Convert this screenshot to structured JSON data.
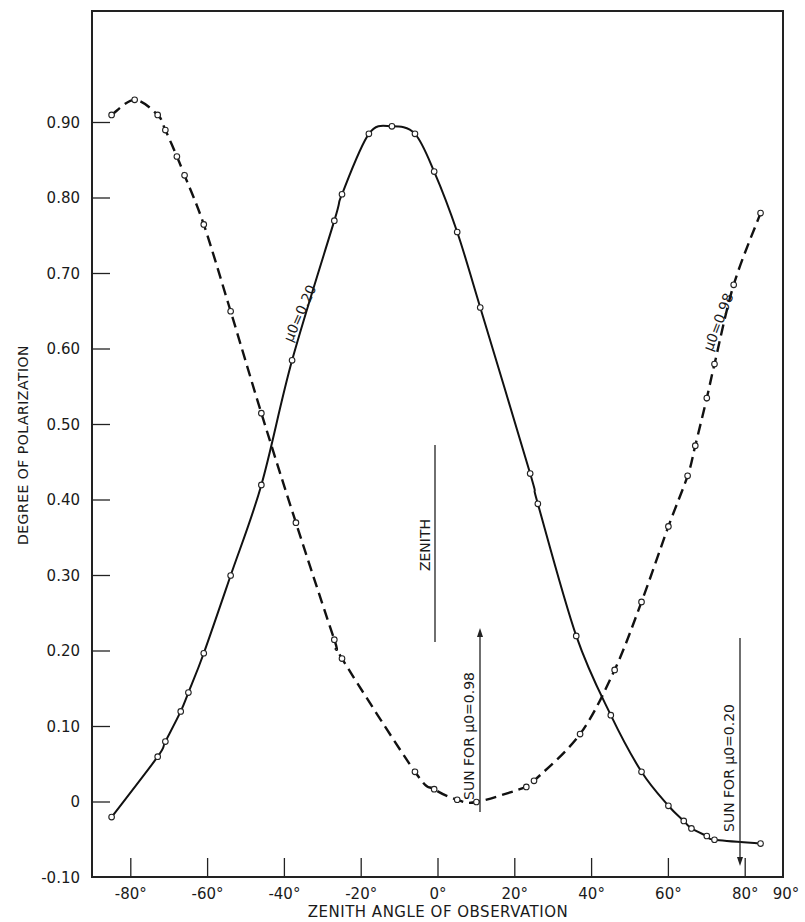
{
  "chart_data": {
    "type": "line",
    "title": "",
    "xlabel": "ZENITH ANGLE OF OBSERVATION",
    "ylabel": "DEGREE OF POLARIZATION",
    "xlim": [
      -90,
      90
    ],
    "ylim": [
      -0.1,
      1.0
    ],
    "grid": false,
    "x_ticks": [
      -80,
      -60,
      -40,
      -20,
      0,
      20,
      40,
      60,
      80
    ],
    "x_tick_labels": [
      "-80°",
      "-60°",
      "-40°",
      "-20°",
      "0°",
      "20°",
      "40°",
      "60°",
      "80°",
      "90°"
    ],
    "y_ticks": [
      -0.1,
      0,
      0.1,
      0.2,
      0.3,
      0.4,
      0.5,
      0.6,
      0.7,
      0.8,
      0.9
    ],
    "y_tick_labels": [
      "-0.10",
      "0",
      "0.10",
      "0.20",
      "0.30",
      "0.40",
      "0.50",
      "0.60",
      "0.70",
      "0.80",
      "0.90"
    ],
    "series": [
      {
        "name": "μ0=0.20",
        "label": "μ0=0.20",
        "style": "solid",
        "points": [
          [
            -85,
            -0.02
          ],
          [
            -73,
            0.06
          ],
          [
            -71,
            0.08
          ],
          [
            -67,
            0.12
          ],
          [
            -65,
            0.145
          ],
          [
            -61,
            0.197
          ],
          [
            -54,
            0.3
          ],
          [
            -46,
            0.42
          ],
          [
            -38,
            0.585
          ],
          [
            -27,
            0.77
          ],
          [
            -25,
            0.805
          ],
          [
            -18,
            0.885
          ],
          [
            -12,
            0.895
          ],
          [
            -6,
            0.885
          ],
          [
            -1,
            0.835
          ],
          [
            5,
            0.755
          ],
          [
            11,
            0.655
          ],
          [
            24,
            0.435
          ],
          [
            26,
            0.395
          ],
          [
            36,
            0.22
          ],
          [
            45,
            0.115
          ],
          [
            53,
            0.04
          ],
          [
            60,
            -0.005
          ],
          [
            64,
            -0.025
          ],
          [
            66,
            -0.035
          ],
          [
            70,
            -0.045
          ],
          [
            72,
            -0.05
          ],
          [
            84,
            -0.055
          ]
        ]
      },
      {
        "name": "μ0=0.98",
        "label": "μ0=0.98",
        "style": "dashed",
        "points": [
          [
            -85,
            0.91
          ],
          [
            -79,
            0.93
          ],
          [
            -73,
            0.91
          ],
          [
            -71,
            0.89
          ],
          [
            -68,
            0.855
          ],
          [
            -66,
            0.83
          ],
          [
            -61,
            0.765
          ],
          [
            -54,
            0.65
          ],
          [
            -46,
            0.515
          ],
          [
            -37,
            0.37
          ],
          [
            -27,
            0.215
          ],
          [
            -25,
            0.19
          ],
          [
            -6,
            0.04
          ],
          [
            -1,
            0.017
          ],
          [
            5,
            0.003
          ],
          [
            10,
            0.0
          ],
          [
            23,
            0.02
          ],
          [
            25,
            0.028
          ],
          [
            37,
            0.09
          ],
          [
            46,
            0.175
          ],
          [
            53,
            0.265
          ],
          [
            60,
            0.365
          ],
          [
            65,
            0.432
          ],
          [
            67,
            0.472
          ],
          [
            70,
            0.535
          ],
          [
            72,
            0.58
          ],
          [
            77,
            0.685
          ],
          [
            84,
            0.78
          ]
        ]
      }
    ],
    "annotations": [
      {
        "text": "ZENITH",
        "x": 0,
        "orientation": "vertical",
        "marker": "vertical line"
      },
      {
        "text": "SUN FOR μ0=0.98",
        "x": 10,
        "orientation": "vertical",
        "marker": "arrow up"
      },
      {
        "text": "SUN FOR μ0=0.20",
        "x": 78.5,
        "orientation": "vertical",
        "marker": "arrow down"
      }
    ]
  },
  "labels": {
    "ylabel": "DEGREE OF POLARIZATION",
    "xlabel": "ZENITH ANGLE OF OBSERVATION",
    "series_a": "μ0=0.20",
    "series_b": "μ0=0.98",
    "zenith": "ZENITH",
    "sun_098": "SUN FOR μ0=0.98",
    "sun_020": "SUN FOR μ0=0.20"
  }
}
